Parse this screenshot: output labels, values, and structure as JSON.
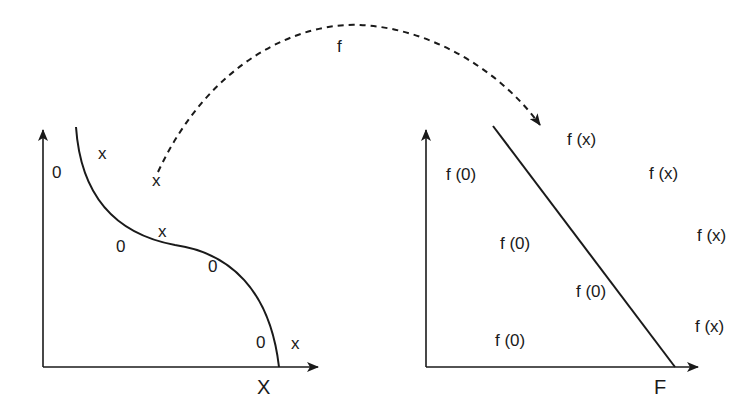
{
  "diagram": {
    "mapping_label": "f",
    "input_space": {
      "axis_label": "X",
      "points": [
        {
          "label": "x",
          "x": 98,
          "y": 153
        },
        {
          "label": "0",
          "x": 52,
          "y": 172
        },
        {
          "label": "x",
          "x": 152,
          "y": 180
        },
        {
          "label": "x",
          "x": 158,
          "y": 231
        },
        {
          "label": "0",
          "x": 116,
          "y": 246
        },
        {
          "label": "0",
          "x": 208,
          "y": 266
        },
        {
          "label": "0",
          "x": 256,
          "y": 342
        },
        {
          "label": "x",
          "x": 291,
          "y": 343
        }
      ]
    },
    "feature_space": {
      "axis_label": "F",
      "points": [
        {
          "label": "f (x)",
          "x": 567,
          "y": 139
        },
        {
          "label": "f (0)",
          "x": 446,
          "y": 174
        },
        {
          "label": "f (x)",
          "x": 649,
          "y": 173
        },
        {
          "label": "f (0)",
          "x": 500,
          "y": 243
        },
        {
          "label": "f (x)",
          "x": 697,
          "y": 235
        },
        {
          "label": "f (0)",
          "x": 576,
          "y": 291
        },
        {
          "label": "f (x)",
          "x": 695,
          "y": 326
        },
        {
          "label": "f (0)",
          "x": 495,
          "y": 340
        }
      ]
    },
    "colors": {
      "stroke": "#1a1a1a",
      "background": "#ffffff"
    }
  }
}
